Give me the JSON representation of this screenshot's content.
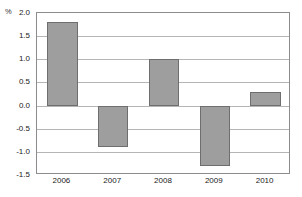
{
  "chart_data": {
    "type": "bar",
    "title": "",
    "xlabel": "",
    "ylabel": "%",
    "unit_label": "%",
    "categories": [
      "2006",
      "2007",
      "2008",
      "2009",
      "2010"
    ],
    "values": [
      1.8,
      -0.9,
      1.0,
      -1.3,
      0.3
    ],
    "series": [
      {
        "name": "",
        "values": [
          1.8,
          -0.9,
          1.0,
          -1.3,
          0.3
        ]
      }
    ],
    "ylim": [
      -1.5,
      2.0
    ],
    "ytick_step": 0.5,
    "yticks": [
      "2.0",
      "1.5",
      "1.0",
      "0.5",
      "0.0",
      "-0.5",
      "-1.0",
      "-1.5"
    ],
    "ytick_values": [
      2.0,
      1.5,
      1.0,
      0.5,
      0.0,
      -0.5,
      -1.0,
      -1.5
    ],
    "grid": true,
    "grid_orientation": "horizontal",
    "legend": false,
    "legend_position": "none",
    "bar_color": "#9e9e9e",
    "bar_border_color": "#6e6e6e",
    "grid_color": "#b5b5b5",
    "frame_color": "#8c8c8c",
    "background_color": "#ffffff",
    "text_color": "#222222"
  }
}
